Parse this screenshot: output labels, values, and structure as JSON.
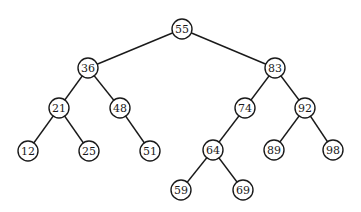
{
  "diagram": {
    "type": "binary-search-tree",
    "node_radius": 10,
    "nodes": [
      {
        "id": "n55",
        "label": "55",
        "x": 182,
        "y": 29
      },
      {
        "id": "n36",
        "label": "36",
        "x": 88,
        "y": 68
      },
      {
        "id": "n83",
        "label": "83",
        "x": 275,
        "y": 68
      },
      {
        "id": "n21",
        "label": "21",
        "x": 59,
        "y": 108
      },
      {
        "id": "n48",
        "label": "48",
        "x": 120,
        "y": 108
      },
      {
        "id": "n74",
        "label": "74",
        "x": 245,
        "y": 108
      },
      {
        "id": "n92",
        "label": "92",
        "x": 305,
        "y": 108
      },
      {
        "id": "n12",
        "label": "12",
        "x": 28,
        "y": 151
      },
      {
        "id": "n25",
        "label": "25",
        "x": 89,
        "y": 151
      },
      {
        "id": "n51",
        "label": "51",
        "x": 150,
        "y": 151
      },
      {
        "id": "n64",
        "label": "64",
        "x": 213,
        "y": 150
      },
      {
        "id": "n89",
        "label": "89",
        "x": 274,
        "y": 150
      },
      {
        "id": "n98",
        "label": "98",
        "x": 333,
        "y": 150
      },
      {
        "id": "n59",
        "label": "59",
        "x": 181,
        "y": 190
      },
      {
        "id": "n69",
        "label": "69",
        "x": 243,
        "y": 190
      }
    ],
    "edges": [
      [
        "n55",
        "n36"
      ],
      [
        "n55",
        "n83"
      ],
      [
        "n36",
        "n21"
      ],
      [
        "n36",
        "n48"
      ],
      [
        "n83",
        "n74"
      ],
      [
        "n83",
        "n92"
      ],
      [
        "n21",
        "n12"
      ],
      [
        "n21",
        "n25"
      ],
      [
        "n48",
        "n51"
      ],
      [
        "n74",
        "n64"
      ],
      [
        "n92",
        "n89"
      ],
      [
        "n92",
        "n98"
      ],
      [
        "n64",
        "n59"
      ],
      [
        "n64",
        "n69"
      ]
    ]
  }
}
